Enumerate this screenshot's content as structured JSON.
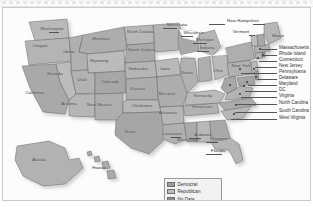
{
  "figure": {
    "type": "choropleth-map",
    "region": "United States",
    "rendering": "grayscale scan"
  },
  "legend": {
    "items": [
      {
        "label": "Democrat",
        "color": "#9a9a9a"
      },
      {
        "label": "Republican",
        "color": "#bdbdbd"
      },
      {
        "label": "No Data",
        "color": "#8d8d8d"
      }
    ]
  },
  "state_labels": [
    {
      "name": "Washington",
      "x": 48,
      "y": 21
    },
    {
      "name": "Oregon",
      "x": 36,
      "y": 38
    },
    {
      "name": "Idaho",
      "x": 66,
      "y": 44
    },
    {
      "name": "Montana",
      "x": 97,
      "y": 25
    },
    {
      "name": "North Dakota",
      "x": 131,
      "y": 27
    },
    {
      "name": "South Dakota",
      "x": 132,
      "y": 45
    },
    {
      "name": "Wyoming",
      "x": 94,
      "y": 52
    },
    {
      "name": "Nevada",
      "x": 50,
      "y": 66
    },
    {
      "name": "Utah",
      "x": 78,
      "y": 70
    },
    {
      "name": "Colorado",
      "x": 106,
      "y": 74
    },
    {
      "name": "Nebraska",
      "x": 133,
      "y": 62
    },
    {
      "name": "Kansas",
      "x": 133,
      "y": 84
    },
    {
      "name": "California",
      "x": 28,
      "y": 86
    },
    {
      "name": "Arizona",
      "x": 63,
      "y": 96
    },
    {
      "name": "New Mexico",
      "x": 92,
      "y": 99
    },
    {
      "name": "Oklahoma",
      "x": 137,
      "y": 100
    },
    {
      "name": "Texas",
      "x": 125,
      "y": 125
    },
    {
      "name": "Iowa",
      "x": 160,
      "y": 62
    },
    {
      "name": "Missouri",
      "x": 162,
      "y": 86
    },
    {
      "name": "Arkansas",
      "x": 163,
      "y": 105
    },
    {
      "name": "Louisiana",
      "x": 167,
      "y": 126
    },
    {
      "name": "Minnesota",
      "x": 172,
      "y": 17
    },
    {
      "name": "Wisconsin",
      "x": 190,
      "y": 25
    },
    {
      "name": "Illinois",
      "x": 182,
      "y": 65
    },
    {
      "name": "Michigan",
      "x": 201,
      "y": 32
    },
    {
      "name": "Indiana",
      "x": 203,
      "y": 40
    },
    {
      "name": "Ohio",
      "x": 214,
      "y": 63
    },
    {
      "name": "Kentucky",
      "x": 198,
      "y": 88
    },
    {
      "name": "Tennessee",
      "x": 197,
      "y": 99
    },
    {
      "name": "Mississippi",
      "x": 183,
      "y": 132
    },
    {
      "name": "Alabama",
      "x": 198,
      "y": 127
    },
    {
      "name": "Georgia",
      "x": 214,
      "y": 131
    },
    {
      "name": "Florida",
      "x": 214,
      "y": 143
    },
    {
      "name": "New York",
      "x": 238,
      "y": 58
    },
    {
      "name": "New Hampshire",
      "x": 239,
      "y": 13
    },
    {
      "name": "Vermont",
      "x": 238,
      "y": 24
    },
    {
      "name": "Maine",
      "x": 275,
      "y": 28
    },
    {
      "name": "Alaska",
      "x": 35,
      "y": 152
    },
    {
      "name": "Hawaii",
      "x": 95,
      "y": 160
    }
  ],
  "callouts": [
    {
      "label": "Massachusetts"
    },
    {
      "label": "Rhode Island"
    },
    {
      "label": "Connecticut"
    },
    {
      "label": "New Jersey"
    },
    {
      "label": "Pennsylvania"
    },
    {
      "label": "Delaware"
    },
    {
      "label": "Maryland"
    },
    {
      "label": "DC"
    },
    {
      "label": "Virginia"
    },
    {
      "label": "North Carolina"
    },
    {
      "label": "South Carolina"
    },
    {
      "label": "West Virginia"
    }
  ]
}
